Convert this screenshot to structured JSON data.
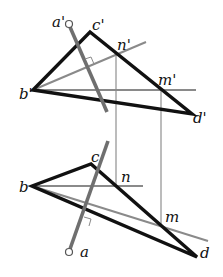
{
  "diagram": {
    "type": "descriptive-geometry-projection",
    "frontal_view": {
      "labels": {
        "a": "a'",
        "b": "b'",
        "c": "c'",
        "d": "d'",
        "n": "n'",
        "m": "m'"
      },
      "points": {
        "a": [
          69,
          24
        ],
        "a_end": [
          107,
          112
        ],
        "b": [
          33,
          90
        ],
        "c": [
          90,
          32
        ],
        "d": [
          192,
          114
        ],
        "n": [
          116,
          55
        ],
        "m": [
          161,
          90
        ]
      },
      "triangle": "b'c'd'",
      "perpendicular_line": "line from a' perpendicular to b'n'"
    },
    "horizontal_view": {
      "labels": {
        "a": "a",
        "b": "b",
        "c": "c",
        "d": "d",
        "n": "n",
        "m": "m"
      },
      "points": {
        "a": [
          69,
          252
        ],
        "a_end": [
          108,
          141
        ],
        "b": [
          32,
          186
        ],
        "c": [
          91,
          164
        ],
        "d": [
          197,
          257
        ],
        "n": [
          116,
          186
        ],
        "m": [
          161,
          226
        ]
      },
      "triangle": "bcd",
      "perpendicular_line": "line from a perpendicular to bm"
    },
    "colors": {
      "triangle_edges": "#111111",
      "auxiliary_lines": "#8a8a8a",
      "normal_line": "#6f6f6f",
      "background": "#ffffff"
    }
  }
}
